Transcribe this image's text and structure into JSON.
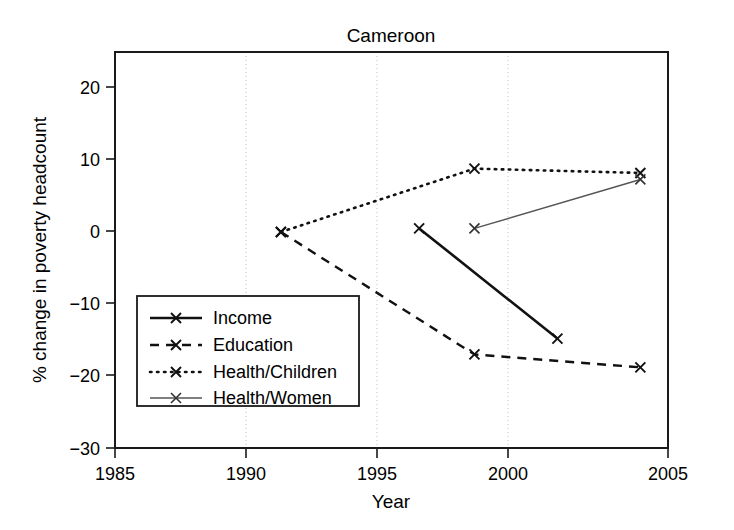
{
  "chart_data": {
    "type": "line",
    "title": "Cameroon",
    "xlabel": "Year",
    "ylabel": "% change in poverty headcount",
    "xlim": [
      1985,
      2005
    ],
    "ylim": [
      -30,
      25
    ],
    "xticks": [
      "1985",
      "1990",
      "1995",
      "2000",
      "2005"
    ],
    "xtick_values": [
      1985,
      1990,
      1995,
      2000,
      2005
    ],
    "yticks": [
      "20",
      "10",
      "0",
      "−10",
      "−20",
      "−30"
    ],
    "ytick_values": [
      20,
      10,
      0,
      -10,
      -20,
      -30
    ],
    "grid": "vertical dotted gridlines at x ticks",
    "legend_position": "left-middle",
    "series": [
      {
        "name": "Income",
        "style": "solid",
        "marker": "x",
        "x": [
          1996,
          2001
        ],
        "values": [
          0.5,
          -14.8
        ]
      },
      {
        "name": "Education",
        "style": "dashed",
        "marker": "x",
        "x": [
          1991,
          1998,
          2004
        ],
        "values": [
          0.0,
          -17.0,
          -18.8
        ]
      },
      {
        "name": "Health/Children",
        "style": "dotted",
        "marker": "x",
        "x": [
          1991,
          1998,
          2004
        ],
        "values": [
          0.0,
          8.8,
          8.2
        ]
      },
      {
        "name": "Health/Women",
        "style": "thin-solid",
        "marker": "x",
        "x": [
          1998,
          2004
        ],
        "values": [
          0.5,
          7.3
        ]
      }
    ]
  },
  "legend": {
    "items": [
      {
        "label": "Income"
      },
      {
        "label": "Education"
      },
      {
        "label": "Health/Children"
      },
      {
        "label": "Health/Women"
      }
    ]
  },
  "colors": {
    "axis": "#1a1a1a",
    "grid": "#cfcfcf",
    "income": "#111111",
    "education": "#111111",
    "health_children": "#111111",
    "health_women": "#555555",
    "background": "#ffffff"
  }
}
